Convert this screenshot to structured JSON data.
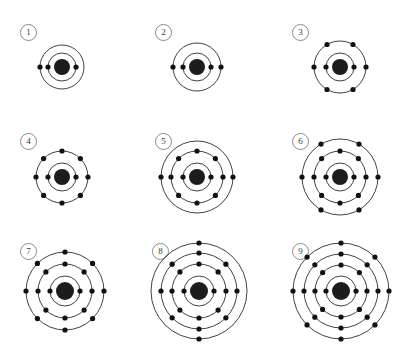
{
  "figure": {
    "title": "",
    "background_color": "#ffffff",
    "ring_color": "#2b2b2b",
    "electron_color": "#111111",
    "nucleus_color": "#1c1c1c",
    "label_border_color": "#8a8a8a",
    "width": 397,
    "height": 346,
    "columns": 3,
    "rows": 3
  },
  "atoms": [
    {
      "label": "1",
      "label_x": 20,
      "label_y": 24,
      "cx": 62,
      "cy": 67,
      "nucleus_r": 8,
      "shells": [
        {
          "radius": 14,
          "electrons": 2,
          "start_angle": 0
        },
        {
          "radius": 22,
          "electrons": 1,
          "start_angle": 180
        }
      ],
      "total_electrons": 3
    },
    {
      "label": "2",
      "label_x": 155,
      "label_y": 24,
      "cx": 197,
      "cy": 67,
      "nucleus_r": 8,
      "shells": [
        {
          "radius": 14,
          "electrons": 2,
          "start_angle": 0
        },
        {
          "radius": 24,
          "electrons": 2,
          "start_angle": 0
        }
      ],
      "total_electrons": 4
    },
    {
      "label": "3",
      "label_x": 292,
      "label_y": 24,
      "cx": 340,
      "cy": 67,
      "nucleus_r": 8,
      "shells": [
        {
          "radius": 14,
          "electrons": 2,
          "start_angle": 0
        },
        {
          "radius": 26,
          "electrons": 6,
          "start_angle": 0
        }
      ],
      "total_electrons": 8
    },
    {
      "label": "4",
      "label_x": 20,
      "label_y": 133,
      "cx": 62,
      "cy": 177,
      "nucleus_r": 8,
      "shells": [
        {
          "radius": 14,
          "electrons": 2,
          "start_angle": 0
        },
        {
          "radius": 26,
          "electrons": 8,
          "start_angle": 0
        }
      ],
      "total_electrons": 10
    },
    {
      "label": "5",
      "label_x": 155,
      "label_y": 133,
      "cx": 197,
      "cy": 177,
      "nucleus_r": 8,
      "shells": [
        {
          "radius": 14,
          "electrons": 2,
          "start_angle": 0
        },
        {
          "radius": 26,
          "electrons": 8,
          "start_angle": 0
        },
        {
          "radius": 36,
          "electrons": 2,
          "start_angle": 0
        }
      ],
      "total_electrons": 12
    },
    {
      "label": "6",
      "label_x": 292,
      "label_y": 133,
      "cx": 340,
      "cy": 177,
      "nucleus_r": 8,
      "shells": [
        {
          "radius": 14,
          "electrons": 2,
          "start_angle": 0
        },
        {
          "radius": 26,
          "electrons": 8,
          "start_angle": 0
        },
        {
          "radius": 38,
          "electrons": 6,
          "start_angle": 0
        }
      ],
      "total_electrons": 16
    },
    {
      "label": "7",
      "label_x": 20,
      "label_y": 243,
      "cx": 65,
      "cy": 291,
      "nucleus_r": 9,
      "shells": [
        {
          "radius": 15,
          "electrons": 2,
          "start_angle": 0
        },
        {
          "radius": 27,
          "electrons": 8,
          "start_angle": 0
        },
        {
          "radius": 39,
          "electrons": 8,
          "start_angle": 0
        }
      ],
      "total_electrons": 18
    },
    {
      "label": "8",
      "label_x": 152,
      "label_y": 243,
      "cx": 199,
      "cy": 291,
      "nucleus_r": 9,
      "shells": [
        {
          "radius": 15,
          "electrons": 2,
          "start_angle": 0
        },
        {
          "radius": 27,
          "electrons": 8,
          "start_angle": 0
        },
        {
          "radius": 38,
          "electrons": 8,
          "start_angle": 0
        },
        {
          "radius": 48,
          "electrons": 2,
          "start_angle": 90
        }
      ],
      "total_electrons": 20
    },
    {
      "label": "9",
      "label_x": 292,
      "label_y": 243,
      "cx": 341,
      "cy": 291,
      "nucleus_r": 9,
      "shells": [
        {
          "radius": 15,
          "electrons": 2,
          "start_angle": 0
        },
        {
          "radius": 26,
          "electrons": 8,
          "start_angle": 0
        },
        {
          "radius": 37,
          "electrons": 8,
          "start_angle": 0
        },
        {
          "radius": 48,
          "electrons": 8,
          "start_angle": 0
        }
      ],
      "total_electrons": 26
    }
  ]
}
